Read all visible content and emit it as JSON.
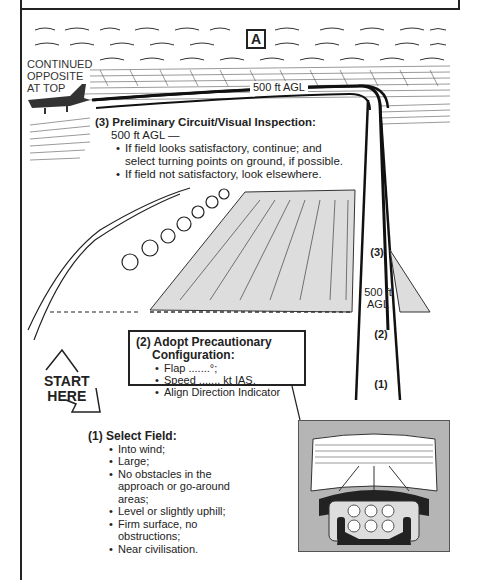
{
  "figure": {
    "panel_label": "A",
    "continued_note": [
      "CONTINUED",
      "OPPOSITE",
      "AT TOP"
    ],
    "altitude_label": "500 ft AGL",
    "step3": {
      "title": "(3) Preliminary Circuit/Visual Inspection:",
      "subtitle": "500 ft AGL —",
      "bullets": [
        "If field looks satisfactory, continue;  and select turning points on ground, if possible.",
        "If field not satisfactory, look elsewhere."
      ]
    },
    "approach_path_labels": {
      "step3": "(3)",
      "altitude_line1": "500 ft",
      "altitude_line2": "AGL",
      "step2": "(2)",
      "step1": "(1)"
    },
    "step2": {
      "title_line1": "(2) Adopt Precautionary",
      "title_line2": "Configuration:",
      "bullets": [
        "Flap .......°;",
        "Speed ....... kt  IAS.",
        "Align Direction Indicator"
      ]
    },
    "start_label": [
      "START",
      "HERE"
    ],
    "step1": {
      "title": "(1) Select Field:",
      "bullets": [
        "Into wind;",
        "Large;",
        "No obstacles in the approach or go-around areas;",
        "Level or slightly uphill;",
        "Firm surface, no obstructions;",
        "Near civilisation."
      ]
    },
    "inset": "cockpit-view-of-field"
  }
}
